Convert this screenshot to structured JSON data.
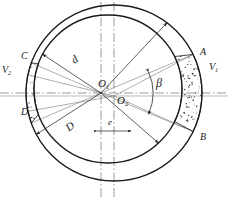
{
  "figure": {
    "type": "engineering-line-drawing",
    "background": "#ffffff",
    "line_color": "#1a1a1a",
    "thin_line_color": "#555555",
    "stipple_color": "#333333"
  },
  "labels": {
    "center_outer": {
      "text": "O",
      "sub": "1",
      "x": 98,
      "y": 84
    },
    "center_inner": {
      "text": "O",
      "sub": "2",
      "x": 118,
      "y": 101
    },
    "angle_beta": {
      "text": "β",
      "x": 155,
      "y": 85
    },
    "diameter_inner": {
      "text": "d",
      "x": 73,
      "y": 62
    },
    "diameter_outer": {
      "text": "D",
      "x": 68,
      "y": 128
    },
    "eccentricity": {
      "text": "e",
      "x": 107,
      "y": 124
    },
    "point_a": {
      "text": "A",
      "x": 201,
      "y": 54
    },
    "point_b": {
      "text": "B",
      "x": 201,
      "y": 139
    },
    "point_c": {
      "text": "C",
      "x": 22,
      "y": 58
    },
    "point_d": {
      "text": "D",
      "x": 22,
      "y": 114
    },
    "velocity_1": {
      "text": "V",
      "sub": "1",
      "x": 210,
      "y": 69
    },
    "velocity_2": {
      "text": "V",
      "sub": "2",
      "x": 3,
      "y": 72
    }
  },
  "geometry": {
    "outer_circle": {
      "cx": 114,
      "cy": 93,
      "r": 88,
      "label": "D"
    },
    "inner_circle": {
      "cx": 108,
      "cy": 89,
      "r": 74,
      "label": "d"
    },
    "center_o1": {
      "cx": 101,
      "cy": 93
    },
    "center_o2": {
      "cx": 114,
      "cy": 96
    },
    "eccentricity_span": {
      "x1": 97,
      "x2": 131,
      "y": 131
    },
    "beta_arc": {
      "cx": 101,
      "cy": 93,
      "r": 52,
      "start_deg": -24,
      "end_deg": 24
    },
    "wedge_right": {
      "start_deg": -26,
      "end_deg": 26
    },
    "sliver_left": {
      "start_deg": 160,
      "end_deg": 200
    }
  },
  "stipple": {
    "seed": 20240917,
    "dot_count_wedge": 520,
    "dot_count_sliver": 70,
    "dot_radius": 0.55
  }
}
